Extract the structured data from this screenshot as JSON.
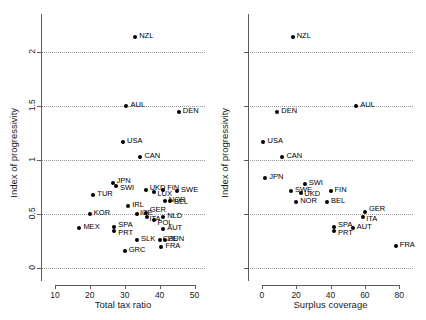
{
  "chart_data": [
    {
      "panel": "left",
      "type": "scatter",
      "title": "",
      "xlabel": "Total tax ratio",
      "ylabel": "Index of progressivity",
      "xlim": [
        6,
        53
      ],
      "ylim": [
        -0.12,
        2.35
      ],
      "xticks": [
        10,
        20,
        30,
        40,
        50
      ],
      "yticks": [
        0,
        0.5,
        1,
        1.5,
        2
      ],
      "ytick_labels": [
        "0",
        "0.5",
        "1",
        "1.5",
        "2"
      ],
      "xtick_labels": [
        "10",
        "20",
        "30",
        "40",
        "50"
      ],
      "grid": true,
      "grid_axis": "y",
      "points": [
        {
          "label": "NZL",
          "x": 33.0,
          "y": 2.14,
          "lx": 4,
          "ly": -1
        },
        {
          "label": "AUL",
          "x": 30.5,
          "y": 1.5,
          "lx": 4,
          "ly": -1
        },
        {
          "label": "DEN",
          "x": 45.5,
          "y": 1.44,
          "lx": 4,
          "ly": -1
        },
        {
          "label": "USA",
          "x": 29.5,
          "y": 1.17,
          "lx": 4,
          "ly": -1
        },
        {
          "label": "CAN",
          "x": 34.5,
          "y": 1.03,
          "lx": 4,
          "ly": -1
        },
        {
          "label": "JPN",
          "x": 26.5,
          "y": 0.79,
          "lx": 4,
          "ly": -2
        },
        {
          "label": "SWI",
          "x": 27.5,
          "y": 0.76,
          "lx": 4,
          "ly": 2
        },
        {
          "label": "TUR",
          "x": 21.0,
          "y": 0.68,
          "lx": 4,
          "ly": -1
        },
        {
          "label": "UKD",
          "x": 36.0,
          "y": 0.72,
          "lx": 4,
          "ly": -2
        },
        {
          "label": "FIN",
          "x": 41.0,
          "y": 0.72,
          "lx": 4,
          "ly": -2
        },
        {
          "label": "LUX",
          "x": 38.5,
          "y": 0.7,
          "lx": 3,
          "ly": 2
        },
        {
          "label": "SWE",
          "x": 45.0,
          "y": 0.71,
          "lx": 4,
          "ly": -1
        },
        {
          "label": "NOR",
          "x": 41.5,
          "y": 0.62,
          "lx": 4,
          "ly": -1
        },
        {
          "label": "BEL",
          "x": 43.0,
          "y": 0.62,
          "lx": 4,
          "ly": 1
        },
        {
          "label": "IRL",
          "x": 31.0,
          "y": 0.57,
          "lx": 4,
          "ly": -1
        },
        {
          "label": "KOR",
          "x": 20.0,
          "y": 0.5,
          "lx": 4,
          "ly": -1
        },
        {
          "label": "ICE",
          "x": 33.5,
          "y": 0.5,
          "lx": 3,
          "ly": -1
        },
        {
          "label": "GER",
          "x": 36.0,
          "y": 0.51,
          "lx": 4,
          "ly": -3
        },
        {
          "label": "ITA",
          "x": 36.5,
          "y": 0.47,
          "lx": 2,
          "ly": 2
        },
        {
          "label": "NLD",
          "x": 41.0,
          "y": 0.47,
          "lx": 4,
          "ly": -1
        },
        {
          "label": "POL",
          "x": 38.5,
          "y": 0.44,
          "lx": 3,
          "ly": 3
        },
        {
          "label": "MEX",
          "x": 17.0,
          "y": 0.37,
          "lx": 4,
          "ly": -1
        },
        {
          "label": "SPA",
          "x": 27.0,
          "y": 0.38,
          "lx": 4,
          "ly": -2
        },
        {
          "label": "PRT",
          "x": 27.0,
          "y": 0.34,
          "lx": 4,
          "ly": 2
        },
        {
          "label": "AUT",
          "x": 41.0,
          "y": 0.36,
          "lx": 4,
          "ly": -1
        },
        {
          "label": "SLK",
          "x": 33.5,
          "y": 0.26,
          "lx": 4,
          "ly": -1
        },
        {
          "label": "CZE",
          "x": 40.0,
          "y": 0.26,
          "lx": 3,
          "ly": -1
        },
        {
          "label": "HUN",
          "x": 41.5,
          "y": 0.26,
          "lx": 3,
          "ly": -1
        },
        {
          "label": "FRA",
          "x": 40.5,
          "y": 0.19,
          "lx": 4,
          "ly": -1
        },
        {
          "label": "GRC",
          "x": 30.0,
          "y": 0.16,
          "lx": 4,
          "ly": -1
        }
      ]
    },
    {
      "panel": "right",
      "type": "scatter",
      "title": "",
      "xlabel": "Surplus coverage",
      "ylabel": "Index of progressivity",
      "xlim": [
        -8,
        88
      ],
      "ylim": [
        -0.12,
        2.35
      ],
      "xticks": [
        0,
        20,
        40,
        60,
        80
      ],
      "yticks": [
        0,
        0.5,
        1,
        1.5,
        2
      ],
      "ytick_labels": [
        "",
        "",
        "",
        "",
        ""
      ],
      "xtick_labels": [
        "0",
        "20",
        "40",
        "60",
        "80"
      ],
      "grid": true,
      "grid_axis": "y",
      "points": [
        {
          "label": "NZL",
          "x": 18.0,
          "y": 2.14,
          "lx": 4,
          "ly": -1
        },
        {
          "label": "AUL",
          "x": 55.0,
          "y": 1.5,
          "lx": 4,
          "ly": -1
        },
        {
          "label": "DEN",
          "x": 9.0,
          "y": 1.44,
          "lx": 4,
          "ly": -1
        },
        {
          "label": "USA",
          "x": 1.0,
          "y": 1.17,
          "lx": 4,
          "ly": -1
        },
        {
          "label": "CAN",
          "x": 12.0,
          "y": 1.03,
          "lx": 4,
          "ly": -1
        },
        {
          "label": "JPN",
          "x": 2.0,
          "y": 0.83,
          "lx": 4,
          "ly": -1
        },
        {
          "label": "SWI",
          "x": 25.0,
          "y": 0.78,
          "lx": 4,
          "ly": -1
        },
        {
          "label": "SWE",
          "x": 17.0,
          "y": 0.71,
          "lx": 4,
          "ly": -1
        },
        {
          "label": "UKD",
          "x": 23.0,
          "y": 0.69,
          "lx": 3,
          "ly": 1
        },
        {
          "label": "FIN",
          "x": 40.0,
          "y": 0.71,
          "lx": 4,
          "ly": -1
        },
        {
          "label": "NOR",
          "x": 20.0,
          "y": 0.61,
          "lx": 4,
          "ly": -1
        },
        {
          "label": "BEL",
          "x": 38.0,
          "y": 0.61,
          "lx": 4,
          "ly": -1
        },
        {
          "label": "GER",
          "x": 60.0,
          "y": 0.52,
          "lx": 4,
          "ly": -3
        },
        {
          "label": "ITA",
          "x": 59.0,
          "y": 0.47,
          "lx": 3,
          "ly": 2
        },
        {
          "label": "SPA",
          "x": 42.0,
          "y": 0.38,
          "lx": 4,
          "ly": -2
        },
        {
          "label": "PRT",
          "x": 42.0,
          "y": 0.34,
          "lx": 4,
          "ly": 2
        },
        {
          "label": "AUT",
          "x": 53.0,
          "y": 0.37,
          "lx": 4,
          "ly": -1
        },
        {
          "label": "FRA",
          "x": 78.0,
          "y": 0.2,
          "lx": 4,
          "ly": -1
        }
      ]
    }
  ]
}
